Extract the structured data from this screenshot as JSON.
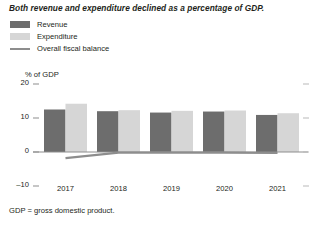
{
  "title": "Both revenue and expenditure declined as a percentage of GDP.",
  "legend": {
    "items": [
      {
        "label": "Revenue",
        "type": "swatch",
        "color": "#6d6d6d"
      },
      {
        "label": "Expenditure",
        "type": "swatch",
        "color": "#d6d6d6"
      },
      {
        "label": "Overall fiscal balance",
        "type": "line",
        "color": "#8d8d8d"
      }
    ]
  },
  "footnote": "GDP = gross domestic product.",
  "axis": {
    "y_title": "% of GDP",
    "y_ticks": [
      "20",
      "10",
      "0",
      "–10"
    ],
    "x_ticks": [
      "2017",
      "2018",
      "2019",
      "2020",
      "2021"
    ]
  },
  "chart_data": {
    "type": "bar",
    "title": "Both revenue and expenditure declined as a percentage of GDP.",
    "xlabel": "",
    "ylabel": "% of GDP",
    "ylim": [
      -10,
      20
    ],
    "yticks": [
      -10,
      0,
      10,
      20
    ],
    "grid": false,
    "legend_position": "top-left",
    "categories": [
      "2017",
      "2018",
      "2019",
      "2020",
      "2021"
    ],
    "series": [
      {
        "name": "Revenue",
        "type": "bar",
        "color": "#6d6d6d",
        "values": [
          12.5,
          12.0,
          11.6,
          11.9,
          10.9
        ]
      },
      {
        "name": "Expenditure",
        "type": "bar",
        "color": "#d6d6d6",
        "values": [
          14.2,
          12.3,
          12.1,
          12.2,
          11.4
        ]
      },
      {
        "name": "Overall fiscal balance",
        "type": "line",
        "color": "#8d8d8d",
        "values": [
          -1.8,
          -0.2,
          -0.2,
          -0.2,
          -0.3
        ]
      }
    ]
  }
}
